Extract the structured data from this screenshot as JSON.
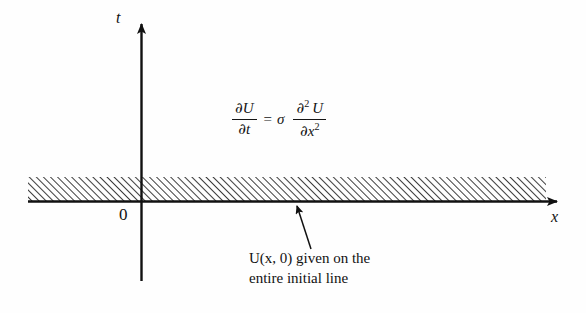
{
  "figure": {
    "kind": "pde-initial-value-diagram",
    "background_color": "#fefefe",
    "ink_color": "#111111"
  },
  "axes": {
    "vertical_label": "t",
    "horizontal_label": "x",
    "origin_label": "0",
    "vertical_axis_name": "t-axis",
    "horizontal_axis_name": "x-axis"
  },
  "equation": {
    "lhs": {
      "numerator_partial": "∂",
      "numerator_var": "U",
      "denominator_partial": "∂",
      "denominator_var": "t"
    },
    "relation": "=",
    "coefficient": "σ",
    "rhs": {
      "numerator_partial": "∂",
      "numerator_exponent": "2",
      "numerator_var": "U",
      "denominator_partial": "∂",
      "denominator_var": "x",
      "denominator_exponent": "2"
    },
    "plain_text": "∂U/∂t = σ ∂²U/∂x²"
  },
  "annotation": {
    "line1": "U(x, 0) given on the",
    "line2": "entire initial line",
    "pointer": "leader-arrow-to-initial-line"
  },
  "hatched_region": {
    "description": "hatched band above the initial line",
    "hatch_angle_degrees": 45,
    "hatch_spacing_px": 5,
    "left_px": 28,
    "right_px": 546,
    "top_px": 177,
    "bottom_px": 201
  }
}
